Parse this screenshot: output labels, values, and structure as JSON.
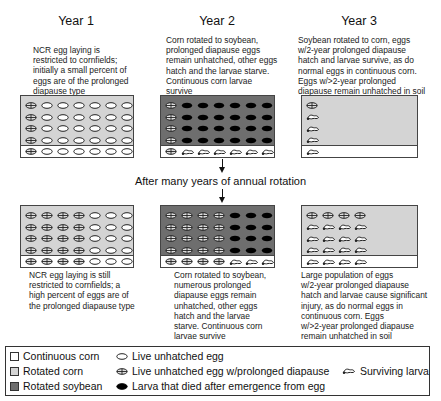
{
  "years": [
    {
      "title": "Year 1",
      "top_desc": [
        "NCR egg laying is",
        "restricted to cornfields;",
        "initially a small percent of",
        "eggs are of the prolonged",
        "diapause type"
      ]
    },
    {
      "title": "Year 2",
      "top_desc": [
        "Corn rotated to soybean,",
        "prolonged diapause eggs",
        "remain unhatched, other eggs",
        "hatch and the larvae starve.",
        "Continuous corn larvae",
        "survive"
      ]
    },
    {
      "title": "Year 3",
      "top_desc": [
        "Soybean rotated to corn, eggs",
        "w/2-year prolonged diapause",
        "hatch and larvae survive, as do",
        "normal eggs in continuous corn.",
        "Eggs w/>2-year prolonged",
        "diapause remain unhatched in soil"
      ]
    }
  ],
  "middle_label": "After many years of annual rotation",
  "bottom_desc": [
    [
      "NCR egg laying is still",
      "restricted to cornfields; a",
      "high percent of eggs are of",
      "the prolonged diapause type"
    ],
    [
      "Corn rotated to soybean,",
      "numerous prolonged",
      "diapause eggs remain",
      "unhatched, other eggs",
      "hatch and the larvae",
      "starve. Continuous corn",
      "larvae survive"
    ],
    [
      "Large population of eggs",
      "w/2-year prolonged diapause",
      "hatch and larvae cause significant",
      "injury, as do normal eggs in",
      "continuous corn. Eggs",
      "w/>2-year prolonged diapause",
      "remain unhatched in soil"
    ]
  ],
  "panels": {
    "top": [
      {
        "field": "rotated-corn",
        "rows": [
          [
            "P",
            "E",
            "E",
            "E",
            "E",
            "E",
            "E"
          ],
          [
            "P",
            "E",
            "E",
            "E",
            "E",
            "E",
            "E"
          ],
          [
            "P",
            "E",
            "E",
            "E",
            "E",
            "E",
            "E"
          ],
          [
            "P",
            "E",
            "E",
            "E",
            "E",
            "E",
            "E"
          ]
        ],
        "strip": [
          "P",
          "E",
          "E",
          "E",
          "E",
          "E",
          "E"
        ]
      },
      {
        "field": "rotated-soybean",
        "rows": [
          [
            "P",
            "D",
            "D",
            "D",
            "D",
            "D",
            "D"
          ],
          [
            "P",
            "D",
            "D",
            "D",
            "D",
            "D",
            "D"
          ],
          [
            "P",
            "D",
            "D",
            "D",
            "D",
            "D",
            "D"
          ],
          [
            "P",
            "D",
            "D",
            "D",
            "D",
            "D",
            "D"
          ]
        ],
        "strip": [
          "P",
          "L",
          "L",
          "L",
          "L",
          "L",
          "L"
        ]
      },
      {
        "field": "rotated-corn",
        "rows": [
          [
            "P"
          ],
          [
            "L"
          ],
          [
            "L"
          ],
          [
            "L"
          ]
        ],
        "strip": [
          "L"
        ]
      }
    ],
    "bottom": [
      {
        "field": "rotated-corn",
        "rows": [
          [
            "P",
            "P",
            "P",
            "P",
            "E",
            "E",
            "E"
          ],
          [
            "P",
            "P",
            "P",
            "P",
            "E",
            "E",
            "E"
          ],
          [
            "P",
            "P",
            "P",
            "P",
            "E",
            "E",
            "E"
          ],
          [
            "P",
            "P",
            "P",
            "P",
            "E",
            "E",
            "E"
          ]
        ],
        "strip": [
          "P",
          "P",
          "P",
          "P",
          "E",
          "E",
          "E"
        ]
      },
      {
        "field": "rotated-soybean",
        "rows": [
          [
            "P",
            "P",
            "P",
            "P",
            "D",
            "D",
            "D"
          ],
          [
            "P",
            "P",
            "P",
            "P",
            "D",
            "D",
            "D"
          ],
          [
            "P",
            "P",
            "P",
            "P",
            "D",
            "D",
            "D"
          ],
          [
            "P",
            "P",
            "P",
            "P",
            "D",
            "D",
            "D"
          ]
        ],
        "strip": [
          "P",
          "P",
          "P",
          "P",
          "L",
          "L",
          "L"
        ]
      },
      {
        "field": "rotated-corn",
        "rows": [
          [
            "P",
            "P",
            "P",
            "P"
          ],
          [
            "L",
            "L",
            "L",
            "L"
          ],
          [
            "L",
            "L",
            "L",
            "L"
          ],
          [
            "L",
            "L",
            "L",
            "L"
          ]
        ],
        "strip": [
          "L",
          "L",
          "L",
          "L"
        ]
      }
    ]
  },
  "colors": {
    "continuous_corn": "#ffffff",
    "rotated_corn": "#d4d4d4",
    "rotated_soybean": "#6e6e6e"
  },
  "legend": {
    "continuous_corn": "Continuous corn",
    "rotated_corn": "Rotated corn",
    "rotated_soybean": "Rotated soybean",
    "live_egg": "Live unhatched egg",
    "prolonged_egg": "Live unhatched egg w/prolonged diapause",
    "dead_larva": "Larva that died after emergence from egg",
    "surviving_larva": "Surviving larva"
  }
}
